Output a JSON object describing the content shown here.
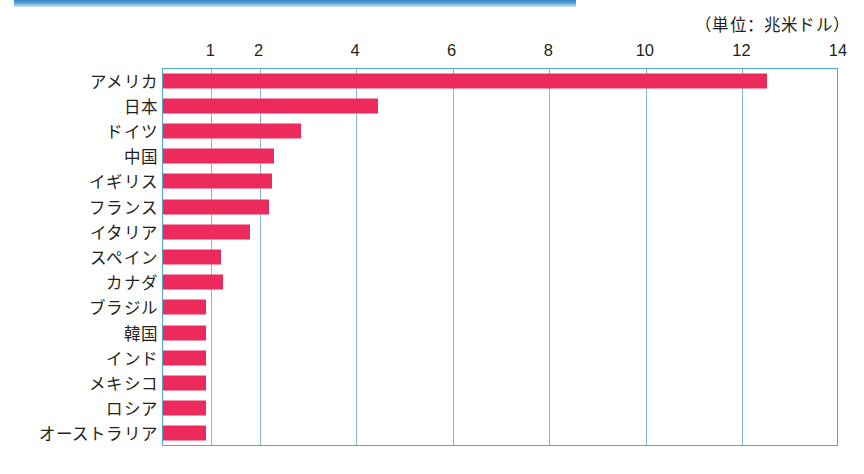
{
  "decor": {
    "top_band_name": "blue-header-band"
  },
  "chart_data": {
    "type": "bar",
    "orientation": "horizontal",
    "title": "",
    "subtitle": "",
    "unit_caption": "（単位：兆米ドル）",
    "xlabel": "",
    "ylabel": "",
    "xlim": [
      0,
      14
    ],
    "ylim": null,
    "grid": true,
    "legend": null,
    "tick_labels": [
      "1",
      "2",
      "4",
      "6",
      "8",
      "10",
      "12",
      "14"
    ],
    "tick_values": [
      1,
      2,
      4,
      6,
      8,
      10,
      12,
      14
    ],
    "bar_color": "#ec2a5b",
    "axis_color": "#4ea8e0",
    "grid_color": "#7fb9e2",
    "categories": [
      "アメリカ",
      "日本",
      "ドイツ",
      "中国",
      "イギリス",
      "フランス",
      "イタリア",
      "スペイン",
      "カナダ",
      "ブラジル",
      "韓国",
      "インド",
      "メキシコ",
      "ロシア",
      "オーストラリア"
    ],
    "values": [
      12.5,
      4.45,
      2.85,
      2.3,
      2.25,
      2.2,
      1.8,
      1.2,
      1.25,
      0.9,
      0.9,
      0.9,
      0.9,
      0.9,
      0.9
    ]
  }
}
